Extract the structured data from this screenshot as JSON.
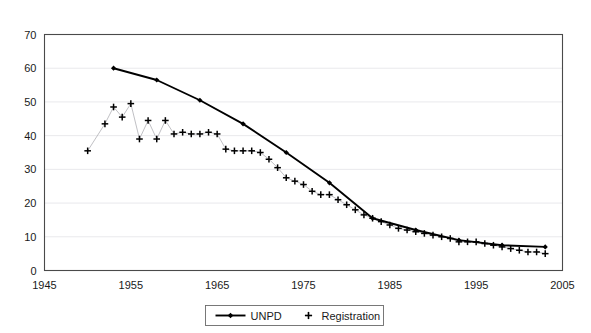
{
  "chart_data": {
    "type": "line",
    "title": "",
    "subtitle": "",
    "xlabel": "",
    "ylabel": "",
    "xlim": [
      1945,
      2005
    ],
    "ylim": [
      0,
      70
    ],
    "xticks": [
      1945,
      1955,
      1965,
      1975,
      1985,
      1995,
      2005
    ],
    "xtick_labels": [
      "1945",
      "1955",
      "1965",
      "1975",
      "1985",
      "1995",
      "2005"
    ],
    "yticks": [
      0,
      10,
      20,
      30,
      40,
      50,
      60,
      70
    ],
    "ytick_labels": [
      "0",
      "10",
      "20",
      "30",
      "40",
      "50",
      "60",
      "70"
    ],
    "grid": "horizontal",
    "legend_position": "below-center",
    "series": [
      {
        "name": "UNPD",
        "marker": "diamond",
        "color": "#000000",
        "line": true,
        "x": [
          1953,
          1958,
          1963,
          1968,
          1973,
          1978,
          1983,
          1988,
          1993,
          1998,
          2003
        ],
        "values": [
          60.0,
          56.5,
          50.5,
          43.5,
          35.0,
          26.0,
          15.5,
          12.0,
          9.0,
          7.5,
          7.0
        ]
      },
      {
        "name": "Registration",
        "marker": "plus",
        "color": "#000000",
        "line": false,
        "x": [
          1950,
          1952,
          1953,
          1954,
          1955,
          1956,
          1957,
          1958,
          1959,
          1960,
          1961,
          1962,
          1963,
          1964,
          1965,
          1966,
          1967,
          1968,
          1969,
          1970,
          1971,
          1972,
          1973,
          1974,
          1975,
          1976,
          1977,
          1978,
          1979,
          1980,
          1981,
          1982,
          1983,
          1984,
          1985,
          1986,
          1987,
          1988,
          1989,
          1990,
          1991,
          1992,
          1993,
          1994,
          1995,
          1996,
          1997,
          1998,
          1999,
          2000,
          2001,
          2002,
          2003
        ],
        "values": [
          35.5,
          43.5,
          48.5,
          45.5,
          49.5,
          39.0,
          44.5,
          39.0,
          44.5,
          40.5,
          41.0,
          40.5,
          40.5,
          41.0,
          40.5,
          36.0,
          35.5,
          35.5,
          35.5,
          35.0,
          33.0,
          30.5,
          27.5,
          26.5,
          25.5,
          23.5,
          22.5,
          22.5,
          21.0,
          19.5,
          18.0,
          16.5,
          15.5,
          14.5,
          13.5,
          12.5,
          12.0,
          11.5,
          11.0,
          10.5,
          10.0,
          9.5,
          8.5,
          8.5,
          8.5,
          8.0,
          7.5,
          7.0,
          6.5,
          6.0,
          5.5,
          5.5,
          5.0
        ]
      }
    ]
  },
  "legend": {
    "items": [
      {
        "label": "UNPD",
        "marker": "line-with-diamond"
      },
      {
        "label": "Registration",
        "marker": "plus"
      }
    ]
  },
  "axes": {
    "y_axis_name": "y-axis",
    "x_axis_name": "x-axis"
  }
}
